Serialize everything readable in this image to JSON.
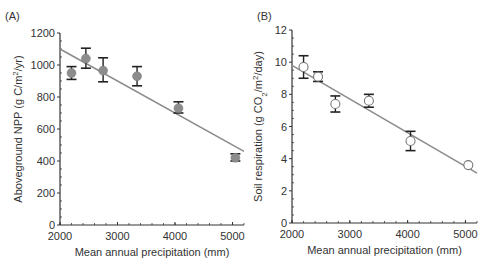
{
  "chart_data": [
    {
      "panel": "(A)",
      "type": "scatter",
      "xlabel": "Mean annual precipitation (mm)",
      "ylabel": "Aboveground NPP (g C/m²/yr)",
      "ylabel_parts": [
        "Aboveground NPP (g C/m",
        "2",
        "/yr)"
      ],
      "xlim": [
        2000,
        5200
      ],
      "ylim": [
        0,
        1200
      ],
      "xticks": [
        2000,
        3000,
        4000,
        5000
      ],
      "yticks": [
        0,
        200,
        400,
        600,
        800,
        1000,
        1200
      ],
      "marker": "filled-circle",
      "marker_color": "#8c8c8c",
      "line_color": "#8c8c8c",
      "grid": false,
      "points": [
        {
          "x": 2200,
          "y": 950,
          "err_low": 910,
          "err_high": 990
        },
        {
          "x": 2450,
          "y": 1040,
          "err_low": 980,
          "err_high": 1105
        },
        {
          "x": 2750,
          "y": 965,
          "err_low": 895,
          "err_high": 1045
        },
        {
          "x": 3340,
          "y": 930,
          "err_low": 870,
          "err_high": 990
        },
        {
          "x": 4060,
          "y": 730,
          "err_low": 700,
          "err_high": 770
        },
        {
          "x": 5050,
          "y": 420,
          "err_low": 400,
          "err_high": 445
        }
      ],
      "regression_line": {
        "x1": 2000,
        "y1": 1100,
        "x2": 5200,
        "y2": 460
      }
    },
    {
      "panel": "(B)",
      "type": "scatter",
      "xlabel": "Mean annual precipitation (mm)",
      "ylabel": "Soil respiration (g CO₂/m²/day)",
      "ylabel_parts": [
        "Soil respiration (g CO",
        "2",
        "/m",
        "2",
        "/day)"
      ],
      "xlim": [
        2000,
        5200
      ],
      "ylim": [
        0,
        12
      ],
      "xticks": [
        2000,
        3000,
        4000,
        5000
      ],
      "yticks": [
        0,
        2,
        4,
        6,
        8,
        10,
        12
      ],
      "marker": "open-circle",
      "marker_color": "#8c8c8c",
      "line_color": "#8c8c8c",
      "grid": false,
      "points": [
        {
          "x": 2200,
          "y": 9.7,
          "err_low": 9.0,
          "err_high": 10.4
        },
        {
          "x": 2450,
          "y": 9.1,
          "err_low": 8.8,
          "err_high": 9.4
        },
        {
          "x": 2750,
          "y": 7.4,
          "err_low": 6.9,
          "err_high": 7.9
        },
        {
          "x": 3330,
          "y": 7.6,
          "err_low": 7.2,
          "err_high": 8.0
        },
        {
          "x": 4050,
          "y": 5.1,
          "err_low": 4.5,
          "err_high": 5.7
        },
        {
          "x": 5050,
          "y": 3.6,
          "err_low": null,
          "err_high": null
        }
      ],
      "regression_line": {
        "x1": 2000,
        "y1": 9.8,
        "x2": 5200,
        "y2": 3.1
      }
    }
  ]
}
